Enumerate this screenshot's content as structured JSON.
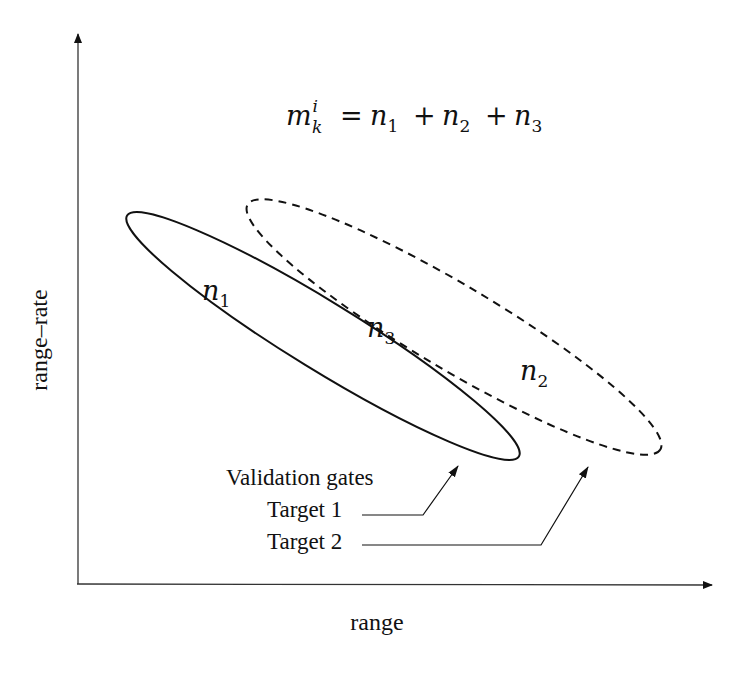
{
  "diagram": {
    "equation": {
      "lhs_base": "m",
      "lhs_sup": "i",
      "lhs_sub": "k",
      "equals": "=",
      "terms": [
        {
          "base": "n",
          "sub": "1"
        },
        {
          "base": "n",
          "sub": "2"
        },
        {
          "base": "n",
          "sub": "3"
        }
      ],
      "plus": "+"
    },
    "axes": {
      "x_label": "range",
      "y_label": "range–rate"
    },
    "regions": [
      {
        "id": "n1",
        "base": "n",
        "sub": "1"
      },
      {
        "id": "n2",
        "base": "n",
        "sub": "2"
      },
      {
        "id": "n3",
        "base": "n",
        "sub": "3"
      }
    ],
    "legend": {
      "title": "Validation gates",
      "items": [
        {
          "label": "Target 1",
          "style": "solid"
        },
        {
          "label": "Target 2",
          "style": "dashed"
        }
      ]
    },
    "colors": {
      "stroke": "#111111",
      "axis": "#333333",
      "background": "#ffffff"
    }
  }
}
